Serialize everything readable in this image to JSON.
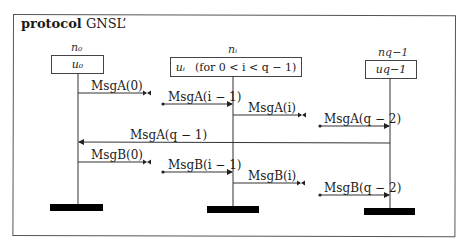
{
  "diagram": {
    "title_keyword": "protocol",
    "title_name": "GNSL’",
    "processes": [
      {
        "name": "n₀",
        "local": "u₀",
        "note": ""
      },
      {
        "name": "nᵢ",
        "local": "uᵢ",
        "note": "(for 0 < i < q − 1)"
      },
      {
        "name": "n_{q−1}",
        "name_display": "nq−1",
        "local": "u_{q−1}",
        "local_display": "uq−1"
      }
    ],
    "messages": [
      {
        "label": "MsgA(0)",
        "from": "n₀",
        "to": "(next)",
        "direction": "right"
      },
      {
        "label": "MsgA(i − 1)",
        "from": "(prev)",
        "to": "nᵢ",
        "direction": "right"
      },
      {
        "label": "MsgA(i)",
        "from": "nᵢ",
        "to": "(next)",
        "direction": "right"
      },
      {
        "label": "MsgA(q − 2)",
        "from": "(prev)",
        "to": "n_{q−1}",
        "direction": "right"
      },
      {
        "label": "MsgA(q − 1)",
        "from": "n_{q−1}",
        "to": "n₀",
        "direction": "left"
      },
      {
        "label": "MsgB(0)",
        "from": "n₀",
        "to": "(next)",
        "direction": "right"
      },
      {
        "label": "MsgB(i − 1)",
        "from": "(prev)",
        "to": "nᵢ",
        "direction": "right"
      },
      {
        "label": "MsgB(i)",
        "from": "nᵢ",
        "to": "(next)",
        "direction": "right"
      },
      {
        "label": "MsgB(q − 2)",
        "from": "(prev)",
        "to": "n_{q−1}",
        "direction": "right"
      }
    ]
  }
}
